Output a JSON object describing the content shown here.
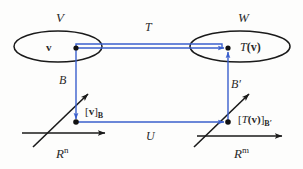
{
  "figure": {
    "type": "commutative-diagram",
    "colors": {
      "mapping_arrow": "#3a5fcd",
      "axis": "#1a1a1a",
      "ellipse": "#1a1a1a",
      "point": "#111111",
      "text": "#2a2a2a",
      "background": "#fdfdfc"
    }
  },
  "labels": {
    "domain_space": "V",
    "codomain_space": "W",
    "top_map": "T",
    "bottom_map": "U",
    "left_basis": "B",
    "right_basis": "B′",
    "left_coordinate_space": "R",
    "left_coordinate_exponent": "n",
    "right_coordinate_space": "R",
    "right_coordinate_exponent": "m",
    "vector": "v",
    "image_vector_fn": "T",
    "image_vector_arg": "(v)",
    "left_coord_open": "[",
    "left_coord_vec": "v",
    "left_coord_close": "]",
    "left_coord_sub": "B",
    "right_coord_open": "[",
    "right_coord_fn": "T",
    "right_coord_arg": "(v)",
    "right_coord_close": "]",
    "right_coord_sub": "B′"
  },
  "nodes": [
    {
      "name": "v",
      "x": 76,
      "y": 48,
      "inside": "V"
    },
    {
      "name": "T(v)",
      "x": 228,
      "y": 48,
      "inside": "W"
    },
    {
      "name": "[v]_B",
      "x": 76,
      "y": 122,
      "inside": "R^n"
    },
    {
      "name": "[T(v)]_B'",
      "x": 228,
      "y": 122,
      "inside": "R^m"
    }
  ],
  "edges": [
    {
      "name": "T",
      "from": "v",
      "to": "T(v)",
      "direction": "right",
      "color": "#3a5fcd"
    },
    {
      "name": "B",
      "from": "v",
      "to": "[v]_B",
      "direction": "down",
      "color": "#3a5fcd"
    },
    {
      "name": "B′",
      "from": "[T(v)]_B'",
      "to": "T(v)",
      "direction": "up",
      "color": "#3a5fcd"
    },
    {
      "name": "U",
      "from": "[v]_B",
      "to": "[T(v)]_B'",
      "direction": "right",
      "color": "#3a5fcd"
    }
  ]
}
